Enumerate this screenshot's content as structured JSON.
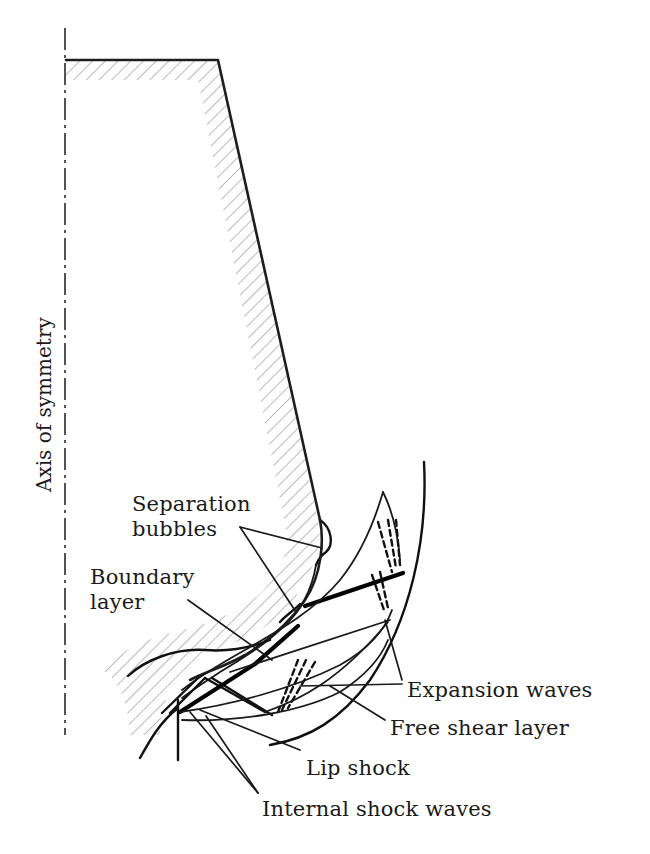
{
  "diagram": {
    "title": "",
    "axis_label": "Axis of symmetry",
    "labels": {
      "separation_bubbles_line1": "Separation",
      "separation_bubbles_line2": "bubbles",
      "boundary_layer_line1": "Boundary",
      "boundary_layer_line2": "layer",
      "expansion_waves": "Expansion waves",
      "free_shear_layer": "Free shear layer",
      "lip_shock": "Lip shock",
      "internal_shock_waves": "Internal shock waves"
    },
    "colors": {
      "line": "#1a1a1a",
      "hatch": "#9a9a9a",
      "background": "#ffffff"
    }
  }
}
